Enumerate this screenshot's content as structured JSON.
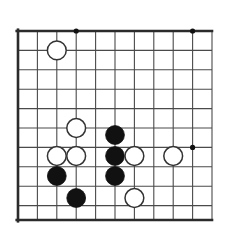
{
  "diagram": {
    "kind": "go-board-diagram",
    "background_color": "#ffffff",
    "line_color": "#4a4a4a",
    "border_color": "#2b2b2b",
    "black_stone_color": "#111111",
    "white_stone_fill": "#ffffff",
    "white_stone_edge": "#333333",
    "star_point_color": "#111111",
    "board_size_label": "19x19",
    "visible_columns": 11,
    "visible_rows": 10,
    "cell_size_px": 19.4,
    "line_width_px": 1.1,
    "border_width_px": 2.6,
    "stone_radius_px": 9.4
  },
  "geometry": {
    "x_lines": [
      18,
      37.4,
      56.8,
      76.2,
      95.6,
      115,
      134.4,
      153.8,
      173.2,
      192.6,
      212
    ],
    "y_lines": [
      31,
      50.4,
      69.8,
      89.2,
      108.6,
      128,
      147.4,
      166.8,
      186.2,
      205.6,
      220
    ],
    "edges": {
      "top": 31,
      "left": 18,
      "bottom": 220,
      "right": 212,
      "thick_edges": [
        "top",
        "left",
        "bottom"
      ]
    }
  },
  "star_points": [
    {
      "name": "star-point-top-left",
      "col": 3,
      "row": 0,
      "x": 76.2,
      "y": 31
    },
    {
      "name": "star-point-top-right",
      "col": 9,
      "row": 0,
      "x": 192.6,
      "y": 31
    },
    {
      "name": "star-point-right-center",
      "col": 9,
      "row": 6,
      "x": 192.6,
      "y": 147.4
    }
  ],
  "stones": [
    {
      "name": "white-stone-upper-left",
      "color": "white",
      "col": 2,
      "row": 1,
      "x": 56.8,
      "y": 50.4,
      "label": ""
    },
    {
      "name": "white-stone-center-upper",
      "color": "white",
      "col": 3,
      "row": 5,
      "x": 76.2,
      "y": 128,
      "label": ""
    },
    {
      "name": "black-stone-center-top",
      "color": "black",
      "col": 5,
      "row": 6,
      "x": 115,
      "y": 135,
      "label": ""
    },
    {
      "name": "white-stone-left-a",
      "color": "white",
      "col": 2,
      "row": 7,
      "x": 56.8,
      "y": 156,
      "label": ""
    },
    {
      "name": "white-stone-left-b",
      "color": "white",
      "col": 3,
      "row": 7,
      "x": 76.2,
      "y": 156,
      "label": ""
    },
    {
      "name": "black-stone-center-mid",
      "color": "black",
      "col": 5,
      "row": 7,
      "x": 115,
      "y": 156,
      "label": ""
    },
    {
      "name": "white-stone-right-a",
      "color": "white",
      "col": 6,
      "row": 7,
      "x": 134.4,
      "y": 156,
      "label": ""
    },
    {
      "name": "white-stone-right-b",
      "color": "white",
      "col": 8,
      "row": 7,
      "x": 173.2,
      "y": 156,
      "label": ""
    },
    {
      "name": "black-stone-lower-left",
      "color": "black",
      "col": 2,
      "row": 8,
      "x": 56.8,
      "y": 176,
      "label": ""
    },
    {
      "name": "black-stone-center-bottom",
      "color": "black",
      "col": 5,
      "row": 8,
      "x": 115,
      "y": 176,
      "label": ""
    },
    {
      "name": "black-stone-bottom",
      "color": "black",
      "col": 3,
      "row": 9,
      "x": 76.2,
      "y": 198,
      "label": ""
    },
    {
      "name": "white-stone-bottom-right",
      "color": "white",
      "col": 6,
      "row": 9,
      "x": 134.4,
      "y": 198,
      "label": ""
    }
  ],
  "counts": {
    "black_stones": 5,
    "white_stones": 7,
    "total_stones": 12,
    "star_points": 3
  }
}
